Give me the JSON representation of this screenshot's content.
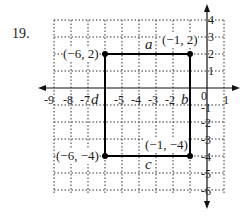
{
  "problem_number": "19.",
  "x_ticks": [
    "-9",
    "-8",
    "-7",
    "-5",
    "-4",
    "-3",
    "-2",
    "0",
    "1"
  ],
  "y_ticks_pos": [
    "4",
    "3",
    "2",
    "1"
  ],
  "y_ticks_neg": [
    "-1",
    "-2",
    "-3",
    "-4",
    "-5",
    "-6"
  ],
  "points": {
    "top_left": "(−6, 2)",
    "top_right": "(−1, 2)",
    "bottom_left": "(−6, −4)",
    "bottom_right": "(−1, −4)"
  },
  "side_labels": {
    "top": "a",
    "right": "b",
    "bottom": "c",
    "left": "d"
  },
  "colors": {
    "axis": "#111111",
    "grid": "#333333",
    "rect": "#000000"
  }
}
